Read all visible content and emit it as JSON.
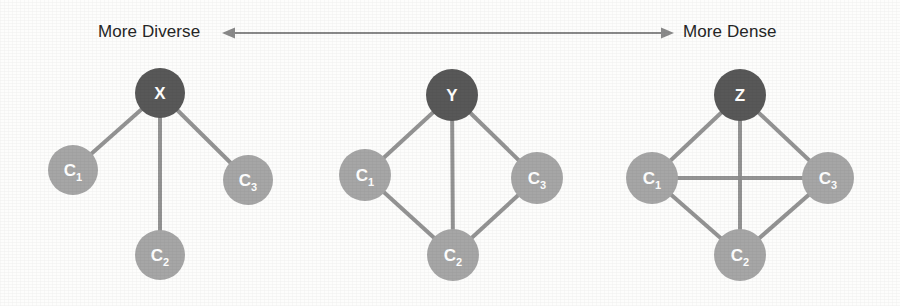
{
  "figure": {
    "title_left": "More Diverse",
    "title_right": "More Dense",
    "arrow": {
      "name": "double-headed-arrow",
      "x_start": 222,
      "x_end": 674,
      "y": 33,
      "color": "#8a8a8a"
    }
  },
  "colors": {
    "hub_node_fill": "#585858",
    "child_node_fill": "#a6a6a6",
    "edge": "#8c8c8c",
    "node_label": "#ffffff",
    "axis_text": "#262626",
    "background": "#fdfdfc"
  },
  "graphs": [
    {
      "id": "graph-x",
      "hub": "X",
      "description": "star",
      "nodes": [
        {
          "id": "X",
          "label": "X",
          "sub": "",
          "cx": 160,
          "cy": 93,
          "r": 25,
          "role": "hub"
        },
        {
          "id": "C1",
          "label": "C",
          "sub": "1",
          "cx": 73,
          "cy": 170,
          "r": 25,
          "role": "child"
        },
        {
          "id": "C2",
          "label": "C",
          "sub": "2",
          "cx": 160,
          "cy": 255,
          "r": 25,
          "role": "child"
        },
        {
          "id": "C3",
          "label": "C",
          "sub": "3",
          "cx": 248,
          "cy": 180,
          "r": 25,
          "role": "child"
        }
      ],
      "edges": [
        [
          "X",
          "C1"
        ],
        [
          "X",
          "C2"
        ],
        [
          "X",
          "C3"
        ]
      ]
    },
    {
      "id": "graph-y",
      "hub": "Y",
      "description": "diamond",
      "nodes": [
        {
          "id": "Y",
          "label": "Y",
          "sub": "",
          "cx": 452,
          "cy": 95,
          "r": 26,
          "role": "hub"
        },
        {
          "id": "C1",
          "label": "C",
          "sub": "1",
          "cx": 365,
          "cy": 175,
          "r": 26,
          "role": "child"
        },
        {
          "id": "C2",
          "label": "C",
          "sub": "2",
          "cx": 453,
          "cy": 255,
          "r": 26,
          "role": "child"
        },
        {
          "id": "C3",
          "label": "C",
          "sub": "3",
          "cx": 537,
          "cy": 178,
          "r": 26,
          "role": "child"
        }
      ],
      "edges": [
        [
          "Y",
          "C1"
        ],
        [
          "Y",
          "C2"
        ],
        [
          "Y",
          "C3"
        ],
        [
          "C1",
          "C2"
        ],
        [
          "C2",
          "C3"
        ]
      ]
    },
    {
      "id": "graph-z",
      "hub": "Z",
      "description": "complete",
      "nodes": [
        {
          "id": "Z",
          "label": "Z",
          "sub": "",
          "cx": 740,
          "cy": 95,
          "r": 26,
          "role": "hub"
        },
        {
          "id": "C1",
          "label": "C",
          "sub": "1",
          "cx": 652,
          "cy": 178,
          "r": 26,
          "role": "child"
        },
        {
          "id": "C2",
          "label": "C",
          "sub": "2",
          "cx": 740,
          "cy": 255,
          "r": 26,
          "role": "child"
        },
        {
          "id": "C3",
          "label": "C",
          "sub": "3",
          "cx": 828,
          "cy": 178,
          "r": 26,
          "role": "child"
        }
      ],
      "edges": [
        [
          "Z",
          "C1"
        ],
        [
          "Z",
          "C2"
        ],
        [
          "Z",
          "C3"
        ],
        [
          "C1",
          "C2"
        ],
        [
          "C2",
          "C3"
        ],
        [
          "C1",
          "C3"
        ]
      ]
    }
  ]
}
